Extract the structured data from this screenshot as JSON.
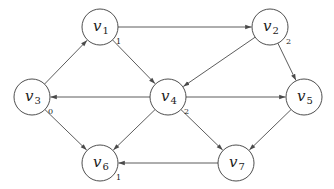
{
  "nodes": [
    {
      "id": "v1",
      "name": "v",
      "sub": "1",
      "weight": "1"
    },
    {
      "id": "v2",
      "name": "v",
      "sub": "2",
      "weight": "2"
    },
    {
      "id": "v3",
      "name": "v",
      "sub": "3",
      "weight": "0"
    },
    {
      "id": "v4",
      "name": "v",
      "sub": "4",
      "weight": "2"
    },
    {
      "id": "v5",
      "name": "v",
      "sub": "5",
      "weight": ""
    },
    {
      "id": "v6",
      "name": "v",
      "sub": "6",
      "weight": "1"
    },
    {
      "id": "v7",
      "name": "v",
      "sub": "7",
      "weight": ""
    }
  ],
  "edges": [
    {
      "from": "v1",
      "to": "v2"
    },
    {
      "from": "v1",
      "to": "v4"
    },
    {
      "from": "v3",
      "to": "v1"
    },
    {
      "from": "v2",
      "to": "v4"
    },
    {
      "from": "v2",
      "to": "v5"
    },
    {
      "from": "v4",
      "to": "v3"
    },
    {
      "from": "v4",
      "to": "v5"
    },
    {
      "from": "v4",
      "to": "v6"
    },
    {
      "from": "v4",
      "to": "v7"
    },
    {
      "from": "v3",
      "to": "v6"
    },
    {
      "from": "v5",
      "to": "v7"
    },
    {
      "from": "v7",
      "to": "v6"
    }
  ],
  "colors": {
    "stroke": "#3a3a3a",
    "background": "#ffffff"
  }
}
